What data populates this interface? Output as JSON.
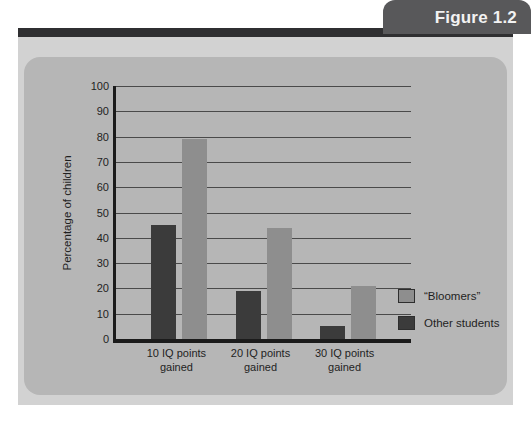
{
  "figure": {
    "tab_label": "Figure 1.2"
  },
  "chart_data": {
    "type": "bar",
    "title": "",
    "xlabel": "",
    "ylabel": "Percentage of children",
    "ylim": [
      0,
      100
    ],
    "ytick_step": 10,
    "yticks": [
      "100",
      "90",
      "80",
      "70",
      "60",
      "50",
      "40",
      "30",
      "20",
      "10",
      "0"
    ],
    "grid": true,
    "legend_position": "right",
    "categories": [
      "10  IQ points gained",
      "20  IQ points gained",
      "30 IQ points gained"
    ],
    "category_lines": [
      [
        "10  IQ points",
        "gained"
      ],
      [
        "20  IQ points",
        "gained"
      ],
      [
        "30 IQ points",
        "gained"
      ]
    ],
    "series": [
      {
        "name": "Other students",
        "color": "#3b3b3b",
        "values": [
          45,
          19,
          5
        ]
      },
      {
        "name": "“Bloomers”",
        "color": "#8e8e8e",
        "values": [
          79,
          44,
          21
        ]
      }
    ],
    "legend": [
      {
        "label": "“Bloomers”",
        "color": "#8e8e8e"
      },
      {
        "label": "Other students",
        "color": "#3b3b3b"
      }
    ]
  },
  "colors": {
    "page_background": "#ffffff",
    "outer_panel": "#d2d2d2",
    "chart_panel": "#b6b6b6",
    "tab_background": "#58585a",
    "tab_text": "#f2f2f2",
    "rule": "#2f2f31",
    "axis": "#1b1b1b",
    "gridline": "#4a4a4a",
    "text": "#1f1f1f",
    "bar_light": "#8e8e8e",
    "bar_dark": "#3b3b3b"
  }
}
